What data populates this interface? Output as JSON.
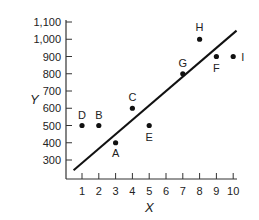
{
  "chart_data": {
    "type": "scatter",
    "title": "",
    "xlabel": "X",
    "ylabel": "Y",
    "xlim": [
      0.5,
      10.5
    ],
    "ylim": [
      200,
      1100
    ],
    "grid": false,
    "x_ticks": [
      "1",
      "2",
      "3",
      "4",
      "5",
      "6",
      "7",
      "8",
      "9",
      "10"
    ],
    "y_ticks": [
      "300",
      "400",
      "500",
      "600",
      "700",
      "800",
      "900",
      "1,000",
      "1,100"
    ],
    "points": [
      {
        "label": "A",
        "x": 3,
        "y": 400
      },
      {
        "label": "B",
        "x": 2,
        "y": 500
      },
      {
        "label": "C",
        "x": 4,
        "y": 600
      },
      {
        "label": "D",
        "x": 1,
        "y": 500
      },
      {
        "label": "E",
        "x": 5,
        "y": 500
      },
      {
        "label": "F",
        "x": 9,
        "y": 900
      },
      {
        "label": "G",
        "x": 7,
        "y": 800
      },
      {
        "label": "H",
        "x": 8,
        "y": 1000
      },
      {
        "label": "I",
        "x": 10,
        "y": 900
      }
    ],
    "regression_line": {
      "x1": 0.5,
      "y1": 240,
      "x2": 10.2,
      "y2": 1050
    }
  }
}
